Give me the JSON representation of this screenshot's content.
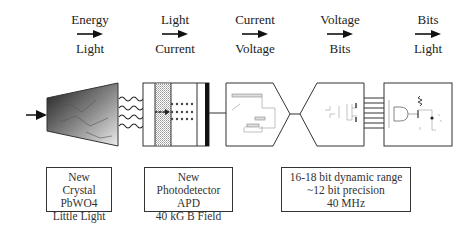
{
  "stages": [
    {
      "from": "Energy",
      "to": "Light",
      "icon": "right-arrow-icon"
    },
    {
      "from": "Light",
      "to": "Current",
      "icon": "right-arrow-icon"
    },
    {
      "from": "Current",
      "to": "Voltage",
      "icon": "right-arrow-icon"
    },
    {
      "from": "Voltage",
      "to": "Bits",
      "icon": "right-arrow-icon"
    },
    {
      "from": "Bits",
      "to": "Light",
      "icon": "right-arrow-icon"
    }
  ],
  "notes": [
    {
      "lines": [
        "New Crystal",
        "PbWO4",
        "Little Light"
      ]
    },
    {
      "lines": [
        "New Photodetector",
        "APD",
        "40 kG B Field"
      ]
    },
    {
      "lines": [
        "16-18 bit dynamic range",
        "~12 bit precision",
        "40 MHz"
      ]
    }
  ],
  "colors": {
    "stroke": "#333333",
    "fill_dark": "#2a2a2a",
    "fill_light": "#e8e8e8"
  }
}
